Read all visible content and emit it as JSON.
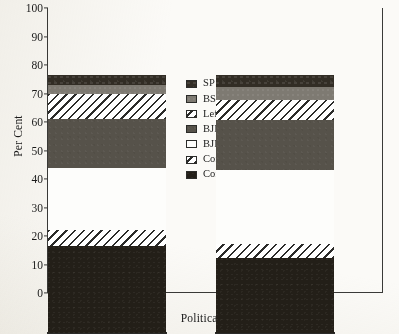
{
  "chart_data": {
    "type": "bar",
    "subtype": "stacked-bar-100",
    "title": "",
    "xlabel": "Political Party",
    "ylabel": "Per Cent",
    "categories": [
      "Female",
      "Male"
    ],
    "ylim": [
      0,
      100
    ],
    "yticks": [
      "0",
      "10",
      "20",
      "30",
      "40",
      "50",
      "60",
      "70",
      "80",
      "90",
      "100"
    ],
    "grid": false,
    "legend_position": "center",
    "series": [
      {
        "name": "Congress",
        "values": [
          30.4,
          26.4
        ],
        "labels": [
          "30.4",
          "26.4"
        ],
        "fill": "solid-black",
        "color": "#231f18"
      },
      {
        "name": "Congress Allies",
        "values": [
          5.9,
          5
        ],
        "labels": [
          "5.9",
          "5"
        ],
        "fill": "diagonal-hatch",
        "color": "#ffffff"
      },
      {
        "name": "BJP",
        "values": [
          21.7,
          25.7
        ],
        "labels": [
          "21.7",
          "25.7"
        ],
        "fill": "open-white",
        "color": "#fdfdfb"
      },
      {
        "name": "BJP Allies",
        "values": [
          17,
          17.5
        ],
        "labels": [
          "17",
          "17.5"
        ],
        "fill": "solid-gray",
        "color": "#56524a"
      },
      {
        "name": "Left+",
        "values": [
          8.8,
          7.2
        ],
        "labels": [
          "8.8",
          "7.2"
        ],
        "fill": "diagonal-hatch",
        "color": "#ffffff"
      },
      {
        "name": "BSP",
        "values": [
          3.2,
          4.5
        ],
        "labels": [
          "3.2",
          "4.5"
        ],
        "fill": "solid-light-gray",
        "color": "#7e7a72"
      },
      {
        "name": "SP",
        "values": [
          3.4,
          4.2
        ],
        "labels": [
          "3.4",
          "4.2"
        ],
        "fill": "solid-dark",
        "color": "#322d25"
      }
    ],
    "legend_entries": [
      {
        "label": "SP",
        "fill": "solid-dark"
      },
      {
        "label": "BSP",
        "fill": "solid-light-gray"
      },
      {
        "label": "Left+",
        "fill": "diagonal-hatch"
      },
      {
        "label": "BJP Allies",
        "fill": "solid-gray"
      },
      {
        "label": "BJP",
        "fill": "open-white"
      },
      {
        "label": "Congress Allies",
        "fill": "diagonal-hatch"
      },
      {
        "label": "Congress",
        "fill": "solid-black"
      }
    ]
  }
}
